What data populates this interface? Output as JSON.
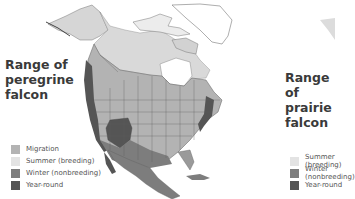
{
  "left_panel": {
    "title_lines": [
      "Range of",
      "peregrine",
      "falcon"
    ],
    "legend": [
      {
        "label": "Migration",
        "color": "#b3b3b3"
      },
      {
        "label": "Summer (breeding)",
        "color": "#e3e3e3"
      },
      {
        "label": "Winter (nonbreeding)",
        "color": "#7d7d7d"
      },
      {
        "label": "Year-round",
        "color": "#555555"
      }
    ]
  },
  "right_panel": {
    "title_lines": [
      "Range of",
      "prairie",
      "falcon"
    ],
    "legend": [
      {
        "label": "Summer (breeding)",
        "color": "#e3e3e3"
      },
      {
        "label": "Winter (nonbreeding)",
        "color": "#7d7d7d"
      },
      {
        "label": "Year-round",
        "color": "#555555"
      }
    ]
  },
  "colors": {
    "migration": "#b3b3b3",
    "summer": "#e3e3e3",
    "winter": "#7d7d7d",
    "year_round": "#555555",
    "border": "#5f5f5f",
    "outline_land": "#ffffff"
  }
}
